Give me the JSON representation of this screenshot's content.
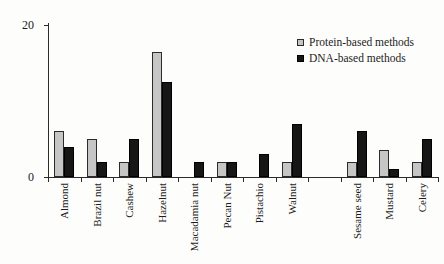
{
  "chart_data": {
    "type": "bar",
    "title": "",
    "xlabel": "",
    "ylabel": "",
    "categories": [
      "Almond",
      "Brazil nut",
      "Cashew",
      "Hazelnut",
      "Macadamia nut",
      "Pecan Nut",
      "Pistachio",
      "Walnut",
      "Sesame seed",
      "Mustard",
      "Celery"
    ],
    "series": [
      {
        "name": "Protein-based methods",
        "color": "#c6c6c6",
        "border_color": "#2b2b2b",
        "values": [
          6,
          5,
          2,
          16.5,
          0,
          2,
          0,
          2,
          2,
          3.5,
          2
        ]
      },
      {
        "name": "DNA-based methods",
        "color": "#161616",
        "border_color": "#000000",
        "values": [
          4,
          2,
          5,
          12.5,
          2,
          2,
          3,
          7,
          6,
          1,
          5
        ]
      }
    ],
    "ylim": [
      0,
      20
    ],
    "y_tick_labels": [
      "0",
      "20"
    ],
    "grid": false,
    "legend_position": "upper-right",
    "group_gap_after_category": "Walnut",
    "group_gap_after_index": 7,
    "axis_color": "#2b2b2b",
    "text_color": "#1c1c1c",
    "background": "#fdfdfb"
  }
}
